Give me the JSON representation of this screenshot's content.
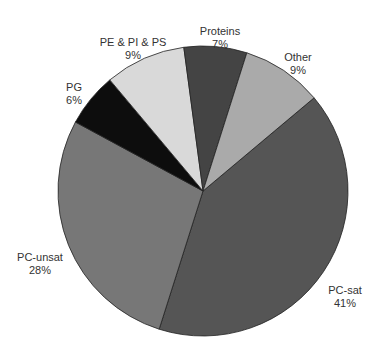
{
  "chart_data": {
    "type": "pie",
    "title": "",
    "start_angle_deg_clockwise_from_top": 50,
    "direction": "clockwise",
    "legend": "none (direct labels)",
    "slices": [
      {
        "label": "PC-sat",
        "value": 41,
        "pct_label": "41%",
        "color": "#555555",
        "label_x": 345,
        "label_y": 284
      },
      {
        "label": "PC-unsat",
        "value": 28,
        "pct_label": "28%",
        "color": "#777777",
        "label_x": 40,
        "label_y": 251
      },
      {
        "label": "PG",
        "value": 6,
        "pct_label": "6%",
        "color": "#0d0d0d",
        "label_x": 74,
        "label_y": 81
      },
      {
        "label": "PE & PI & PS",
        "value": 9,
        "pct_label": "9%",
        "color": "#d9d9d9",
        "label_x": 133,
        "label_y": 36
      },
      {
        "label": "Proteins",
        "value": 7,
        "pct_label": "7%",
        "color": "#444444",
        "label_x": 220,
        "label_y": 25
      },
      {
        "label": "Other",
        "value": 9,
        "pct_label": "9%",
        "color": "#aaaaaa",
        "label_x": 298,
        "label_y": 51
      }
    ],
    "categories": [
      "PC-sat",
      "PC-unsat",
      "PG",
      "PE & PI & PS",
      "Proteins",
      "Other"
    ],
    "values": [
      41,
      28,
      6,
      9,
      7,
      9
    ]
  },
  "geometry": {
    "cx": 203,
    "cy": 191,
    "r": 145
  }
}
